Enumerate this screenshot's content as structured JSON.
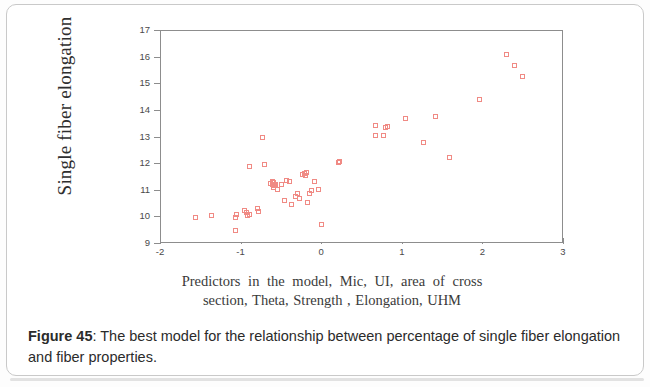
{
  "figure": {
    "caption_label": "Figure 45",
    "caption_separator": ":",
    "caption_text": " The best model for the relationship between percentage of single fiber elongation and fiber properties."
  },
  "chart_data": {
    "type": "scatter",
    "title": "",
    "xlabel_line1": "Predictors  in  the  model,  Mic,  UI,  area  of  cross",
    "xlabel_line2": "section, Theta, Strength , Elongation, UHM",
    "ylabel": "Single fiber elongation",
    "xlim": [
      -2,
      3
    ],
    "ylim": [
      9,
      17
    ],
    "xticks": [
      -2,
      -1,
      0,
      1,
      2,
      3
    ],
    "xtick_labels": [
      "-2",
      "-1",
      "0",
      "1",
      "2",
      "3"
    ],
    "yticks": [
      9,
      10,
      11,
      12,
      13,
      14,
      15,
      16,
      17
    ],
    "ytick_labels": [
      "9",
      "10",
      "11",
      "12",
      "13",
      "14",
      "15",
      "16",
      "17"
    ],
    "grid": false,
    "legend": null,
    "marker": "open-square",
    "marker_color": "#f08a84",
    "series": [
      {
        "name": "Single fiber elongation vs fitted predictor",
        "points": [
          [
            -1.57,
            9.98
          ],
          [
            -1.37,
            10.06
          ],
          [
            -1.08,
            9.5
          ],
          [
            -1.07,
            10.0
          ],
          [
            -1.06,
            10.12
          ],
          [
            -0.96,
            10.25
          ],
          [
            -0.94,
            10.17
          ],
          [
            -0.93,
            10.06
          ],
          [
            -0.9,
            10.09
          ],
          [
            -0.9,
            11.9
          ],
          [
            -0.8,
            10.33
          ],
          [
            -0.79,
            10.21
          ],
          [
            -0.74,
            12.99
          ],
          [
            -0.71,
            11.99
          ],
          [
            -0.64,
            11.28
          ],
          [
            -0.62,
            11.22
          ],
          [
            -0.62,
            11.34
          ],
          [
            -0.6,
            11.12
          ],
          [
            -0.6,
            11.3
          ],
          [
            -0.59,
            11.2
          ],
          [
            -0.58,
            11.25
          ],
          [
            -0.56,
            11.05
          ],
          [
            -0.5,
            11.23
          ],
          [
            -0.47,
            10.65
          ],
          [
            -0.44,
            11.37
          ],
          [
            -0.4,
            11.35
          ],
          [
            -0.38,
            10.47
          ],
          [
            -0.33,
            10.8
          ],
          [
            -0.31,
            10.88
          ],
          [
            -0.28,
            10.72
          ],
          [
            -0.24,
            11.6
          ],
          [
            -0.22,
            11.66
          ],
          [
            -0.21,
            11.57
          ],
          [
            -0.2,
            11.7
          ],
          [
            -0.18,
            10.55
          ],
          [
            -0.16,
            10.9
          ],
          [
            -0.13,
            11.02
          ],
          [
            -0.1,
            11.36
          ],
          [
            -0.04,
            11.04
          ],
          [
            -0.01,
            9.72
          ],
          [
            0.2,
            12.05
          ],
          [
            0.21,
            12.08
          ],
          [
            0.66,
            13.46
          ],
          [
            0.66,
            13.08
          ],
          [
            0.76,
            13.07
          ],
          [
            0.79,
            13.39
          ],
          [
            0.81,
            13.4
          ],
          [
            1.03,
            13.73
          ],
          [
            1.26,
            12.82
          ],
          [
            1.41,
            13.77
          ],
          [
            1.58,
            12.24
          ],
          [
            1.95,
            14.43
          ],
          [
            2.29,
            16.13
          ],
          [
            2.38,
            15.71
          ],
          [
            2.49,
            15.29
          ]
        ]
      }
    ]
  }
}
